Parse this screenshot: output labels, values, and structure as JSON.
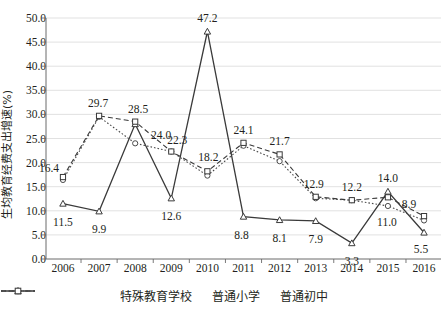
{
  "chart_data": {
    "type": "line",
    "title": "",
    "xlabel": "",
    "ylabel": "生均教育经费支出增速(%)",
    "categories": [
      "2006",
      "2007",
      "2008",
      "2009",
      "2010",
      "2011",
      "2012",
      "2013",
      "2014",
      "2015",
      "2016"
    ],
    "ylim": [
      0,
      50
    ],
    "ytick_labels": [
      "0.0",
      "5.0",
      "10.0",
      "15.0",
      "20.0",
      "25.0",
      "30.0",
      "35.0",
      "40.0",
      "45.0",
      "50.0"
    ],
    "ytick_values": [
      0,
      5,
      10,
      15,
      20,
      25,
      30,
      35,
      40,
      45,
      50
    ],
    "grid": "horizontal",
    "legend_position": "bottom",
    "series": [
      {
        "name": "特殊教育学校",
        "marker": "triangle",
        "line_style": "solid",
        "color": "#3a3a3a",
        "values": [
          11.5,
          9.9,
          28.0,
          12.6,
          47.2,
          8.8,
          8.1,
          7.9,
          3.3,
          14.0,
          5.5
        ],
        "labels": [
          "11.5",
          "9.9",
          "",
          "12.6",
          "47.2",
          "8.8",
          "8.1",
          "7.9",
          "3.3",
          "14.0",
          "5.5"
        ]
      },
      {
        "name": "普通小学",
        "marker": "circle",
        "line_style": "dotted",
        "color": "#4a4a4a",
        "values": [
          16.4,
          29.5,
          24.0,
          22.3,
          17.3,
          23.5,
          20.3,
          12.6,
          12.2,
          11.0,
          8.0
        ],
        "labels": [
          "16.4",
          "",
          "24.0",
          "",
          "",
          "",
          "",
          "",
          "",
          "11.0",
          ""
        ]
      },
      {
        "name": "普通初中",
        "marker": "square",
        "line_style": "dashed",
        "color": "#3a3a3a",
        "values": [
          17.0,
          29.7,
          28.5,
          22.3,
          18.2,
          24.1,
          21.7,
          12.9,
          12.2,
          12.8,
          8.9
        ],
        "labels": [
          "",
          "29.7",
          "28.5",
          "22.3",
          "18.2",
          "24.1",
          "21.7",
          "12.9",
          "12.2",
          "",
          "8.9"
        ]
      }
    ],
    "annotations": [
      {
        "text": "16.4",
        "x": 2006,
        "y": 16.4,
        "dx": -14,
        "dy": -12
      },
      {
        "text": "11.5",
        "x": 2006,
        "y": 11.5,
        "dx": 0,
        "dy": 18
      },
      {
        "text": "29.7",
        "x": 2007,
        "y": 29.7,
        "dx": -1,
        "dy": -13
      },
      {
        "text": "9.9",
        "x": 2007,
        "y": 9.9,
        "dx": 0,
        "dy": 18
      },
      {
        "text": "28.5",
        "x": 2008,
        "y": 28.5,
        "dx": 3,
        "dy": -13
      },
      {
        "text": "24.0",
        "x": 2008,
        "y": 24.0,
        "dx": 26,
        "dy": -8
      },
      {
        "text": "22.3",
        "x": 2009,
        "y": 22.3,
        "dx": 6,
        "dy": -12
      },
      {
        "text": "12.6",
        "x": 2009,
        "y": 12.6,
        "dx": 0,
        "dy": 18
      },
      {
        "text": "47.2",
        "x": 2010,
        "y": 47.2,
        "dx": 0,
        "dy": -13
      },
      {
        "text": "18.2",
        "x": 2010,
        "y": 18.2,
        "dx": 1,
        "dy": -14
      },
      {
        "text": "24.1",
        "x": 2011,
        "y": 24.1,
        "dx": 0,
        "dy": -13
      },
      {
        "text": "8.8",
        "x": 2011,
        "y": 8.8,
        "dx": -2,
        "dy": 18
      },
      {
        "text": "21.7",
        "x": 2012,
        "y": 21.7,
        "dx": 0,
        "dy": -13
      },
      {
        "text": "8.1",
        "x": 2012,
        "y": 8.1,
        "dx": 0,
        "dy": 18
      },
      {
        "text": "12.9",
        "x": 2013,
        "y": 12.9,
        "dx": -2,
        "dy": -13
      },
      {
        "text": "7.9",
        "x": 2013,
        "y": 7.9,
        "dx": 0,
        "dy": 18
      },
      {
        "text": "12.2",
        "x": 2014,
        "y": 12.2,
        "dx": 0,
        "dy": -13
      },
      {
        "text": "3.3",
        "x": 2014,
        "y": 3.3,
        "dx": 0,
        "dy": 18
      },
      {
        "text": "14.0",
        "x": 2015,
        "y": 14.0,
        "dx": 0,
        "dy": -14
      },
      {
        "text": "11.0",
        "x": 2015,
        "y": 11.0,
        "dx": -1,
        "dy": 16
      },
      {
        "text": "8.9",
        "x": 2016,
        "y": 8.9,
        "dx": -15,
        "dy": -12
      },
      {
        "text": "5.5",
        "x": 2016,
        "y": 5.5,
        "dx": -3,
        "dy": 17
      }
    ]
  }
}
